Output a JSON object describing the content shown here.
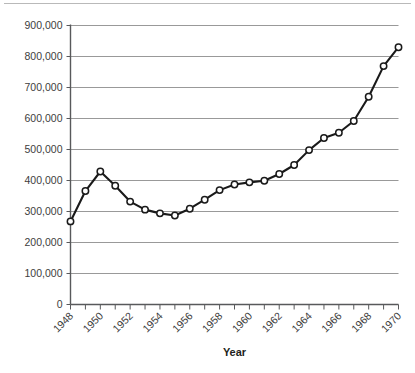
{
  "chart_data": {
    "type": "line",
    "title": "",
    "xlabel": "Year",
    "ylabel": "",
    "xlim": [
      1948,
      1970
    ],
    "ylim": [
      0,
      900000
    ],
    "grid": true,
    "legend": false,
    "marker": "open-circle",
    "line_color": "#1a1a1a",
    "marker_fill": "#ffffff",
    "grid_color": "#8d8d8d",
    "y_ticks": [
      0,
      100000,
      200000,
      300000,
      400000,
      500000,
      600000,
      700000,
      800000,
      900000
    ],
    "y_tick_labels": [
      "0",
      "100,000",
      "200,000",
      "300,000",
      "400,000",
      "500,000",
      "600,000",
      "700,000",
      "800,000",
      "900,000"
    ],
    "x_ticks": [
      1948,
      1949,
      1950,
      1951,
      1952,
      1953,
      1954,
      1955,
      1956,
      1957,
      1958,
      1959,
      1960,
      1961,
      1962,
      1963,
      1964,
      1965,
      1966,
      1967,
      1968,
      1969,
      1970
    ],
    "x_tick_labels": [
      "1948",
      "",
      "1950",
      "",
      "1952",
      "",
      "1954",
      "",
      "1956",
      "",
      "1958",
      "",
      "1960",
      "",
      "1962",
      "",
      "1964",
      "",
      "1966",
      "",
      "1968",
      "",
      "1970"
    ],
    "x": [
      1948,
      1949,
      1950,
      1951,
      1952,
      1953,
      1954,
      1955,
      1956,
      1957,
      1958,
      1959,
      1960,
      1961,
      1962,
      1963,
      1964,
      1965,
      1966,
      1967,
      1968,
      1969,
      1970
    ],
    "values": [
      268000,
      366000,
      429000,
      383000,
      332000,
      306000,
      294000,
      287000,
      309000,
      338000,
      369000,
      387000,
      394000,
      399000,
      421000,
      450000,
      498000,
      537000,
      554000,
      592000,
      670000,
      769000,
      830000
    ],
    "series": [
      {
        "name": "",
        "values": [
          268000,
          366000,
          429000,
          383000,
          332000,
          306000,
          294000,
          287000,
          309000,
          338000,
          369000,
          387000,
          394000,
          399000,
          421000,
          450000,
          498000,
          537000,
          554000,
          592000,
          670000,
          769000,
          830000
        ]
      }
    ]
  }
}
